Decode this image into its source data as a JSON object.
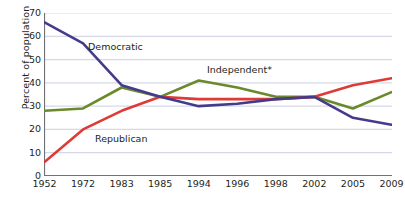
{
  "chart_data": {
    "type": "line",
    "title": "",
    "xlabel": "Year",
    "ylabel": "Percent of population",
    "categories": [
      "1952",
      "1972",
      "1983",
      "1985",
      "1994",
      "1996",
      "1998",
      "2002",
      "2005",
      "2009"
    ],
    "ylim": [
      0,
      70
    ],
    "yticks": [
      0,
      10,
      20,
      30,
      40,
      50,
      60,
      70
    ],
    "grid": "horizontal",
    "legend_position": "inline-annotations",
    "series": [
      {
        "name": "Democratic",
        "color": "#453b8c",
        "values": [
          66,
          57,
          39,
          34,
          30,
          31,
          33,
          34,
          25,
          22
        ]
      },
      {
        "name": "Republican",
        "color": "#de3b37",
        "values": [
          6,
          20,
          28,
          34,
          33,
          33,
          33,
          34,
          39,
          42
        ]
      },
      {
        "name": "Independent*",
        "color": "#6a8a2a",
        "values": [
          28,
          29,
          38,
          34,
          41,
          38,
          34,
          34,
          29,
          36
        ]
      }
    ],
    "annotations": [
      {
        "label": "Democratic",
        "series": "Democratic"
      },
      {
        "label": "Independent*",
        "series": "Independent*"
      },
      {
        "label": "Republican",
        "series": "Republican"
      }
    ]
  },
  "axis": {
    "ylabel": "Percent of population",
    "xlabel": "Year"
  },
  "colors": {
    "democratic": "#453b8c",
    "republican": "#de3b37",
    "independent": "#6a8a2a",
    "gridline": "#d6d8e8",
    "axis": "#6f7174",
    "text": "#231f20"
  }
}
